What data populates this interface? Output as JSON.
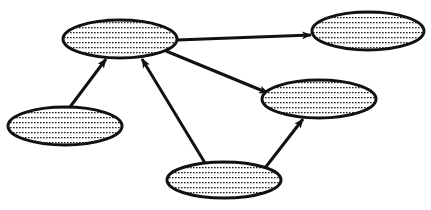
{
  "diagram": {
    "type": "directed-graph",
    "background": "#ffffff",
    "stroke_color": "#111111",
    "fill_pattern": "dotted-stipple",
    "nodes": [
      {
        "id": "A",
        "label": "",
        "cx": 120,
        "cy": 39,
        "rx": 57,
        "ry": 19
      },
      {
        "id": "B",
        "label": "",
        "cx": 368,
        "cy": 31,
        "rx": 56,
        "ry": 19
      },
      {
        "id": "C",
        "label": "",
        "cx": 319,
        "cy": 99,
        "rx": 57,
        "ry": 19
      },
      {
        "id": "D",
        "label": "",
        "cx": 65,
        "cy": 126,
        "rx": 57,
        "ry": 19
      },
      {
        "id": "E",
        "label": "",
        "cx": 224,
        "cy": 180,
        "rx": 57,
        "ry": 18
      }
    ],
    "edges": [
      {
        "from": "A",
        "to": "B",
        "x1": 177,
        "y1": 40,
        "x2": 311,
        "y2": 35
      },
      {
        "from": "A",
        "to": "C",
        "x1": 166,
        "y1": 51,
        "x2": 268,
        "y2": 93
      },
      {
        "from": "D",
        "to": "A",
        "x1": 70,
        "y1": 107,
        "x2": 106,
        "y2": 59
      },
      {
        "from": "E",
        "to": "A",
        "x1": 205,
        "y1": 163,
        "x2": 142,
        "y2": 59
      },
      {
        "from": "E",
        "to": "C",
        "x1": 265,
        "y1": 168,
        "x2": 303,
        "y2": 119
      }
    ]
  }
}
